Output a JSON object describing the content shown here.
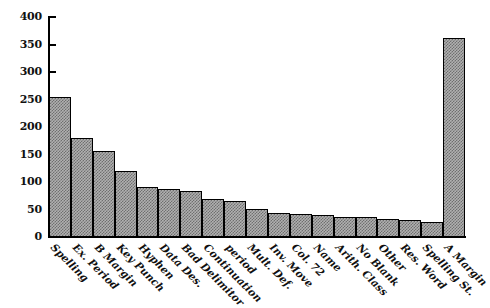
{
  "chart_data": {
    "type": "bar",
    "title": "",
    "subtitle": "",
    "xlabel": "",
    "ylabel": "",
    "ylim": [
      0,
      400
    ],
    "ytick_labels": [
      "400",
      "350",
      "300",
      "250",
      "200",
      "150",
      "100",
      "50",
      "0"
    ],
    "yticks": [
      400,
      350,
      300,
      250,
      200,
      150,
      100,
      50,
      0
    ],
    "grid": false,
    "legend": null,
    "legend_position": "none",
    "orientation": "vertical",
    "bar_style": {
      "fill": "#b0b0b0",
      "pattern": "checkered-dither",
      "edge_color": "#000000"
    },
    "categories": [
      "Spelling",
      "Ex. Period",
      "B Margin",
      "Key Punch",
      "Hyphen",
      "Data Des.",
      "Bad Delimitor",
      "Continuation",
      "period",
      "Mult. Def.",
      "Inv. Move",
      "Col. 72",
      "Name",
      "Arith. Class",
      "No Blank",
      "Other",
      "Res. Word",
      "Spelling St.",
      "A Margin"
    ],
    "values": [
      254,
      180,
      157,
      120,
      91,
      88,
      83,
      70,
      66,
      51,
      44,
      41,
      40,
      37,
      36,
      33,
      31,
      28,
      362
    ]
  }
}
